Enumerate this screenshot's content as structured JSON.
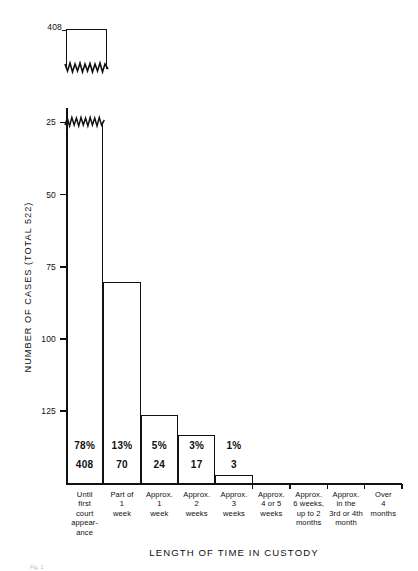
{
  "figure": {
    "caption_fragment": "Fig. 1",
    "break_marker_label": "408",
    "break_marker_name": "axis-break-zigzag"
  },
  "axes": {
    "y_title": "NUMBER OF CASES  (TOTAL 522)",
    "x_title": "LENGTH OF TIME IN CUSTODY",
    "y_ticks": [
      "125",
      "100",
      "75",
      "50",
      "25"
    ],
    "y_tick_values": [
      125,
      100,
      75,
      50,
      25
    ]
  },
  "bar_labels": [
    {
      "pct": "78%",
      "num": "408"
    },
    {
      "pct": "13%",
      "num": "70"
    },
    {
      "pct": "5%",
      "num": "24"
    },
    {
      "pct": "3%",
      "num": "17"
    },
    {
      "pct": "1%",
      "num": "3"
    }
  ],
  "categories_lines": [
    [
      "Until",
      "first",
      "court",
      "appear-",
      "ance"
    ],
    [
      "Part of",
      "1",
      "week"
    ],
    [
      "Approx.",
      "1",
      "week"
    ],
    [
      "Approx.",
      "2",
      "weeks"
    ],
    [
      "Approx.",
      "3",
      "weeks"
    ],
    [
      "Approx.",
      "4 or 5",
      "weeks"
    ],
    [
      "Approx.",
      "6 weeks,",
      "up to 2",
      "months"
    ],
    [
      "Approx.",
      "in the",
      "3rd or 4th",
      "month"
    ],
    [
      "Over",
      "4",
      "months"
    ]
  ],
  "chart_data": {
    "type": "bar",
    "title": "",
    "xlabel": "LENGTH OF TIME IN CUSTODY",
    "ylabel": "NUMBER OF CASES  (TOTAL 522)",
    "total_cases": 522,
    "categories": [
      "Until first court appearance",
      "Part of 1 week",
      "Approx. 1 week",
      "Approx. 2 weeks",
      "Approx. 3 weeks",
      "Approx. 4 or 5 weeks",
      "Approx. 6 weeks, up to 2 months",
      "Approx. in the 3rd or 4th month",
      "Over 4 months"
    ],
    "values": [
      408,
      70,
      24,
      17,
      3,
      0,
      0,
      0,
      0
    ],
    "percentages": [
      "78%",
      "13%",
      "5%",
      "3%",
      "1%",
      "",
      "",
      "",
      ""
    ],
    "ylim": [
      0,
      130
    ],
    "yticks": [
      25,
      50,
      75,
      100,
      125
    ],
    "grid": false,
    "legend": "none",
    "axis_break": {
      "present": true,
      "broken_bar_index": 0,
      "broken_bar_value": 408,
      "displayed_top_label": "408",
      "note": "first bar is truncated with a zigzag break and its true height 408 is shown by a detached box at the top"
    },
    "bar_style": {
      "fill": "#ffffff",
      "edge": "#111111"
    }
  },
  "colors": {
    "ink": "#111111",
    "background": "#ffffff"
  }
}
